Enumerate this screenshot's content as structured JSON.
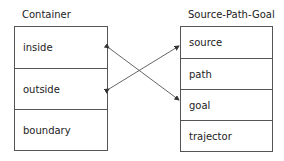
{
  "left": {
    "title": "Container",
    "items": [
      "inside",
      "outside",
      "boundary"
    ]
  },
  "right": {
    "title": "Source-Path-Goal",
    "items": [
      "source",
      "path",
      "goal",
      "trajector"
    ]
  },
  "mappings": [
    {
      "from": "inside",
      "to": "goal"
    },
    {
      "from": "outside",
      "to": "source"
    }
  ]
}
